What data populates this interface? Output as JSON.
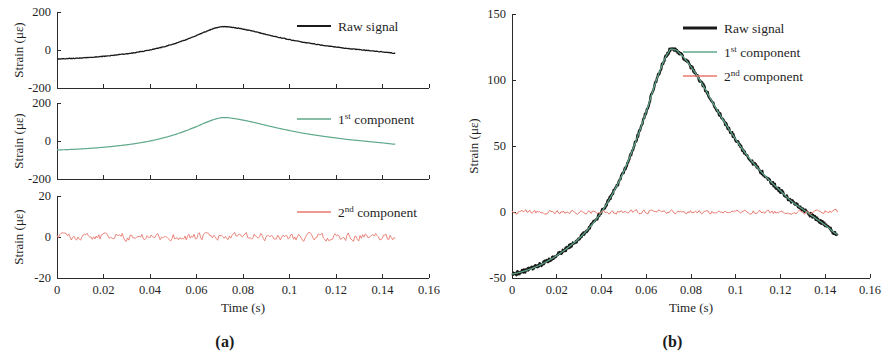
{
  "figure": {
    "panels": [
      {
        "id": "a",
        "caption": "(a)"
      },
      {
        "id": "b",
        "caption": "(b)"
      }
    ]
  },
  "axis_titles": {
    "x": "Time (s)",
    "y": "Strain (με)"
  },
  "legend": {
    "raw": {
      "label": "Raw signal",
      "color": "#1a1a1a"
    },
    "first": {
      "prefix": "1",
      "sup": "st",
      "suffix": " component",
      "label": "1st component",
      "color": "#5fa98a"
    },
    "second": {
      "prefix": "2",
      "sup": "nd",
      "suffix": " component",
      "label": "2nd component",
      "color": "#e8796f"
    }
  },
  "xticks": [
    "0",
    "0.02",
    "0.04",
    "0.06",
    "0.08",
    "0.1",
    "0.12",
    "0.14",
    "0.16"
  ],
  "xtick_values": [
    0,
    0.02,
    0.04,
    0.06,
    0.08,
    0.1,
    0.12,
    0.14,
    0.16
  ],
  "chart_data": [
    {
      "type": "line",
      "panel": "a",
      "subplot": 1,
      "title": "",
      "xlabel": "Time (s)",
      "ylabel": "Strain (με)",
      "xlim": [
        0,
        0.16
      ],
      "ylim": [
        -200,
        200
      ],
      "yticks": [
        -200,
        0,
        200
      ],
      "ytick_labels": [
        "-200",
        "0",
        "200"
      ],
      "xticks": [
        0,
        0.02,
        0.04,
        0.06,
        0.08,
        0.1,
        0.12,
        0.14,
        0.16
      ],
      "grid": false,
      "legend_position": "top-right",
      "series": [
        {
          "name": "Raw signal",
          "color": "#1a1a1a",
          "x": [
            0,
            0.005,
            0.01,
            0.015,
            0.02,
            0.025,
            0.03,
            0.035,
            0.04,
            0.045,
            0.05,
            0.055,
            0.06,
            0.065,
            0.07,
            0.0725,
            0.075,
            0.08,
            0.085,
            0.09,
            0.095,
            0.1,
            0.105,
            0.11,
            0.115,
            0.12,
            0.125,
            0.13,
            0.135,
            0.14,
            0.1455
          ],
          "y": [
            -47,
            -45,
            -42,
            -38,
            -33,
            -27,
            -20,
            -11,
            0,
            14,
            31,
            52,
            76,
            102,
            121,
            123,
            120,
            110,
            97,
            82,
            68,
            55,
            43,
            33,
            24,
            16,
            8,
            2,
            -4,
            -10,
            -17
          ]
        }
      ]
    },
    {
      "type": "line",
      "panel": "a",
      "subplot": 2,
      "title": "",
      "xlabel": "Time (s)",
      "ylabel": "Strain (με)",
      "xlim": [
        0,
        0.16
      ],
      "ylim": [
        -200,
        200
      ],
      "yticks": [
        -200,
        0,
        200
      ],
      "ytick_labels": [
        "-200",
        "0",
        "200"
      ],
      "xticks": [
        0,
        0.02,
        0.04,
        0.06,
        0.08,
        0.1,
        0.12,
        0.14,
        0.16
      ],
      "grid": false,
      "legend_position": "top-right",
      "series": [
        {
          "name": "1st component",
          "color": "#5fa98a",
          "x": [
            0,
            0.005,
            0.01,
            0.015,
            0.02,
            0.025,
            0.03,
            0.035,
            0.04,
            0.045,
            0.05,
            0.055,
            0.06,
            0.065,
            0.07,
            0.0725,
            0.075,
            0.08,
            0.085,
            0.09,
            0.095,
            0.1,
            0.105,
            0.11,
            0.115,
            0.12,
            0.125,
            0.13,
            0.135,
            0.14,
            0.1455
          ],
          "y": [
            -47,
            -45,
            -42,
            -38,
            -33,
            -27,
            -20,
            -11,
            0,
            14,
            31,
            52,
            76,
            102,
            121,
            123,
            120,
            110,
            97,
            82,
            68,
            55,
            43,
            33,
            24,
            16,
            8,
            2,
            -4,
            -10,
            -17
          ]
        }
      ]
    },
    {
      "type": "line",
      "panel": "a",
      "subplot": 3,
      "title": "",
      "xlabel": "Time (s)",
      "ylabel": "Strain (με)",
      "xlim": [
        0,
        0.16
      ],
      "ylim": [
        -20,
        20
      ],
      "yticks": [
        -20,
        0,
        20
      ],
      "ytick_labels": [
        "-20",
        "0",
        "20"
      ],
      "xticks": [
        0,
        0.02,
        0.04,
        0.06,
        0.08,
        0.1,
        0.12,
        0.14,
        0.16
      ],
      "grid": false,
      "legend_position": "top-right",
      "series": [
        {
          "name": "2nd component",
          "color": "#e8796f",
          "description": "low-amplitude noise residual oscillating about 0, range approx -2 to +2",
          "amplitude": 2,
          "mean": 0
        }
      ]
    },
    {
      "type": "line",
      "panel": "b",
      "subplot": 1,
      "title": "",
      "xlabel": "Time (s)",
      "ylabel": "Strain (με)",
      "xlim": [
        0,
        0.16
      ],
      "ylim": [
        -50,
        150
      ],
      "yticks": [
        -50,
        0,
        50,
        100,
        150
      ],
      "ytick_labels": [
        "-50",
        "0",
        "50",
        "100",
        "150"
      ],
      "xticks": [
        0,
        0.02,
        0.04,
        0.06,
        0.08,
        0.1,
        0.12,
        0.14,
        0.16
      ],
      "grid": false,
      "legend_position": "top-right",
      "series": [
        {
          "name": "Raw signal",
          "color": "#1a1a1a",
          "x": [
            0,
            0.005,
            0.01,
            0.015,
            0.02,
            0.025,
            0.03,
            0.035,
            0.04,
            0.045,
            0.05,
            0.055,
            0.06,
            0.065,
            0.07,
            0.0725,
            0.075,
            0.08,
            0.085,
            0.09,
            0.095,
            0.1,
            0.105,
            0.11,
            0.115,
            0.12,
            0.125,
            0.13,
            0.135,
            0.14,
            0.1455
          ],
          "y": [
            -47,
            -45,
            -42,
            -38,
            -33,
            -27,
            -20,
            -11,
            0,
            14,
            31,
            52,
            76,
            102,
            121,
            123,
            120,
            110,
            97,
            82,
            68,
            55,
            43,
            33,
            24,
            16,
            8,
            2,
            -4,
            -10,
            -17
          ]
        },
        {
          "name": "1st component",
          "color": "#5fa98a",
          "x": [
            0,
            0.005,
            0.01,
            0.015,
            0.02,
            0.025,
            0.03,
            0.035,
            0.04,
            0.045,
            0.05,
            0.055,
            0.06,
            0.065,
            0.07,
            0.0725,
            0.075,
            0.08,
            0.085,
            0.09,
            0.095,
            0.1,
            0.105,
            0.11,
            0.115,
            0.12,
            0.125,
            0.13,
            0.135,
            0.14,
            0.1455
          ],
          "y": [
            -47,
            -45,
            -42,
            -38,
            -33,
            -27,
            -20,
            -11,
            0,
            14,
            31,
            52,
            76,
            102,
            121,
            123,
            120,
            110,
            97,
            82,
            68,
            55,
            43,
            33,
            24,
            16,
            8,
            2,
            -4,
            -10,
            -17
          ]
        },
        {
          "name": "2nd component",
          "color": "#e8796f",
          "description": "low-amplitude noise residual oscillating about 0",
          "amplitude": 2,
          "mean": 0
        }
      ]
    }
  ]
}
